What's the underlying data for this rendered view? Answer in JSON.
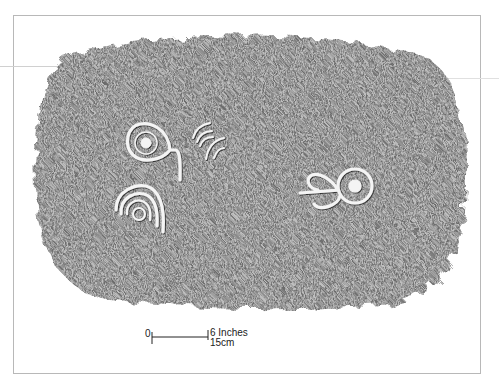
{
  "figure": {
    "frame_color": "#b8b8b8",
    "stone_tone": "#6a6a6a",
    "carvings": [
      {
        "name": "spiral-with-tail",
        "cx": 146,
        "cy": 143
      },
      {
        "name": "arc-strokes",
        "cx": 210,
        "cy": 145
      },
      {
        "name": "concentric-arcs",
        "cx": 138,
        "cy": 212
      },
      {
        "name": "double-loop-with-dot",
        "cx": 343,
        "cy": 188
      }
    ]
  },
  "scale_bar": {
    "zero_label": "0",
    "inches_label": "6 Inches",
    "cm_label": "15cm"
  }
}
